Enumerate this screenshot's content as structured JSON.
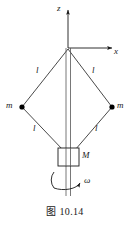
{
  "figure": {
    "caption": "图 10.14",
    "axes": {
      "z_label": "z",
      "x_label": "x"
    },
    "masses": [
      {
        "label": "m",
        "side": "left"
      },
      {
        "label": "m",
        "side": "right"
      }
    ],
    "rod_lengths": [
      {
        "label": "l",
        "edge": "upper-left"
      },
      {
        "label": "l",
        "edge": "upper-right"
      },
      {
        "label": "l",
        "edge": "lower-left"
      },
      {
        "label": "l",
        "edge": "lower-right"
      }
    ],
    "block": {
      "label": "M"
    },
    "rotation": {
      "label": "ω"
    },
    "colors": {
      "line": "#1a1a1a",
      "background": "#ffffff",
      "dot": "#000000"
    }
  }
}
